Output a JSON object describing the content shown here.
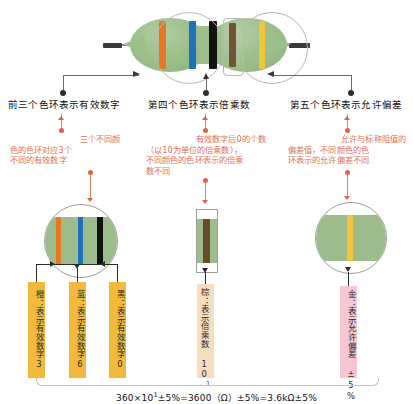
{
  "resistor": {
    "name": "five-band-resistor",
    "bands": [
      {
        "order": 1,
        "name": "band-1-orange",
        "color_name": "橙",
        "color": "#E87722"
      },
      {
        "order": 2,
        "name": "band-2-blue",
        "color_name": "蓝",
        "color": "#1B74BA"
      },
      {
        "order": 3,
        "name": "band-3-black",
        "color_name": "黑",
        "color": "#111111"
      },
      {
        "order": 4,
        "name": "band-4-brown",
        "color_name": "棕",
        "color": "#6B4A27"
      },
      {
        "order": 5,
        "name": "band-5-gold",
        "color_name": "金",
        "color": "#F2C43D"
      }
    ],
    "body_color": "#9CBD8B",
    "lead_color": "#3A3A3A"
  },
  "headings": {
    "first_three": "前三个色环表示有效数字",
    "fourth": "第四个色环表示倍乘数",
    "fifth": "第五个色环表示允许偏差"
  },
  "explanations": {
    "first_three": [
      "三个不同颜",
      "色的色环对应3个",
      "不同的有效数字"
    ],
    "fourth": [
      "有效数字后0的个数",
      "（以10为单位的倍乘数），",
      "不同颜色的色环表示的倍乘",
      "数不同"
    ],
    "fifth": [
      "允许与标称阻值的",
      "偏差值，不同颜色的色",
      "环表示的允许偏差不同"
    ]
  },
  "details": {
    "digits": {
      "chips": [
        {
          "name": "chip-orange-digit3",
          "color_name": "橙",
          "text": "橙：表示有效数字3",
          "bg": "#F2B93C"
        },
        {
          "name": "chip-blue-digit6",
          "color_name": "蓝",
          "text": "蓝：表示有效数字6",
          "bg": "#F2B93C"
        },
        {
          "name": "chip-black-digit0",
          "color_name": "黑",
          "text": "黑：表示有效数字0",
          "bg": "#F2B93C"
        }
      ]
    },
    "multiplier": {
      "chip": {
        "name": "chip-brown-multiplier",
        "color_name": "棕",
        "text": "棕：表示倍乘数 10",
        "exponent": "1",
        "bg": "#F7DCC0"
      }
    },
    "tolerance": {
      "chip": {
        "name": "chip-gold-tolerance",
        "color_name": "金",
        "text": "金：表示允许偏差 ±5%",
        "bg": "#F6C6D2"
      }
    }
  },
  "formula": {
    "text": "360×10",
    "exponent": "1",
    "rest": "±5%=3600（Ω）±5%=3.6kΩ±5%"
  }
}
